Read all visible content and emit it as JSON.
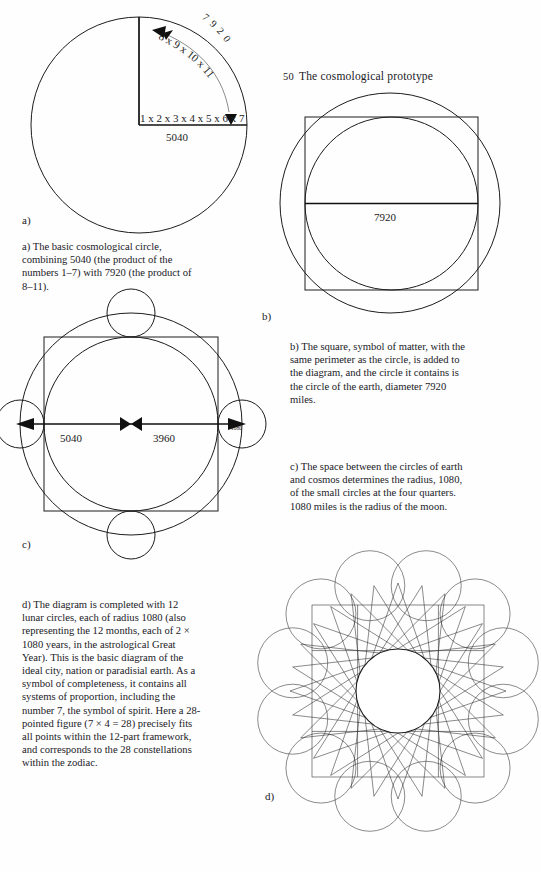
{
  "page": {
    "width": 541,
    "height": 872,
    "background": "#fefefe",
    "ink": "#1c1c1c"
  },
  "header": {
    "folio": "50",
    "title": "The cosmological prototype"
  },
  "figures": {
    "a": {
      "label": "a)",
      "caption": "a)  The basic cosmological circle, combining 5040 (the product of the numbers 1–7) with 7920 (the product of 8–11).",
      "annotations": {
        "arc_value": "7 9 2 0",
        "arc_product": "8 x 9 x 10 x 11",
        "radius_product": "1 x 2 x 3 x 4 x 5 x 6 x 7",
        "radius_value": "5040"
      }
    },
    "b": {
      "label": "b)",
      "caption": "b)  The square, symbol of matter, with the same perimeter as the circle, is added to the diagram, and the circle it contains is the circle of the earth, diameter 7920 miles.",
      "annotations": {
        "diameter_value": "7920"
      }
    },
    "c": {
      "label": "c)",
      "caption": "c)  The space between the circles of earth and cosmos determines the radius, 1080, of the small circles at the four quarters. 1080 miles is the radius of the moon.",
      "annotations": {
        "left_segment": "5040",
        "right_segment": "3960",
        "small_circle_radius": "1080"
      }
    },
    "d": {
      "label": "d)",
      "caption": "d)  The diagram is completed with 12 lunar circles, each of radius 1080 (also representing the 12 months, each of 2 × 1080 years, in the astrological Great Year). This is the basic diagram of the ideal city, nation or paradisial earth. As a symbol of completeness, it contains all systems of proportion, including the number 7, the symbol of spirit. Here a 28-pointed figure (7 × 4 = 28) precisely fits all points within the 12-part framework, and corresponds to the 28 constellations within the zodiac.",
      "annotations": {
        "lunar_circle_count": "12",
        "star_points": "28"
      }
    }
  },
  "chart_data": {
    "type": "diagram",
    "title": "The cosmological prototype",
    "panels": [
      {
        "id": "a",
        "type": "circle-with-radius-and-arc",
        "values": {
          "radius_label": "5040",
          "arc_label": "7920",
          "radius_factors": "1 x 2 x 3 x 4 x 5 x 6 x 7",
          "arc_factors": "8 x 9 x 10 x 11"
        }
      },
      {
        "id": "b",
        "type": "circle-square-circle",
        "values": {
          "inner_circle_diameter": "7920",
          "square": "same perimeter as outer circle"
        }
      },
      {
        "id": "c",
        "type": "circle-square-quarter-circles",
        "values": {
          "earth_radius": "3960",
          "cosmos_radius": "5040",
          "moon_radius": "1080"
        }
      },
      {
        "id": "d",
        "type": "twelve-lunar-circles-with-28-point-star",
        "values": {
          "lunar_circles": 12,
          "star_points": 28,
          "lunar_radius": "1080"
        }
      }
    ]
  }
}
